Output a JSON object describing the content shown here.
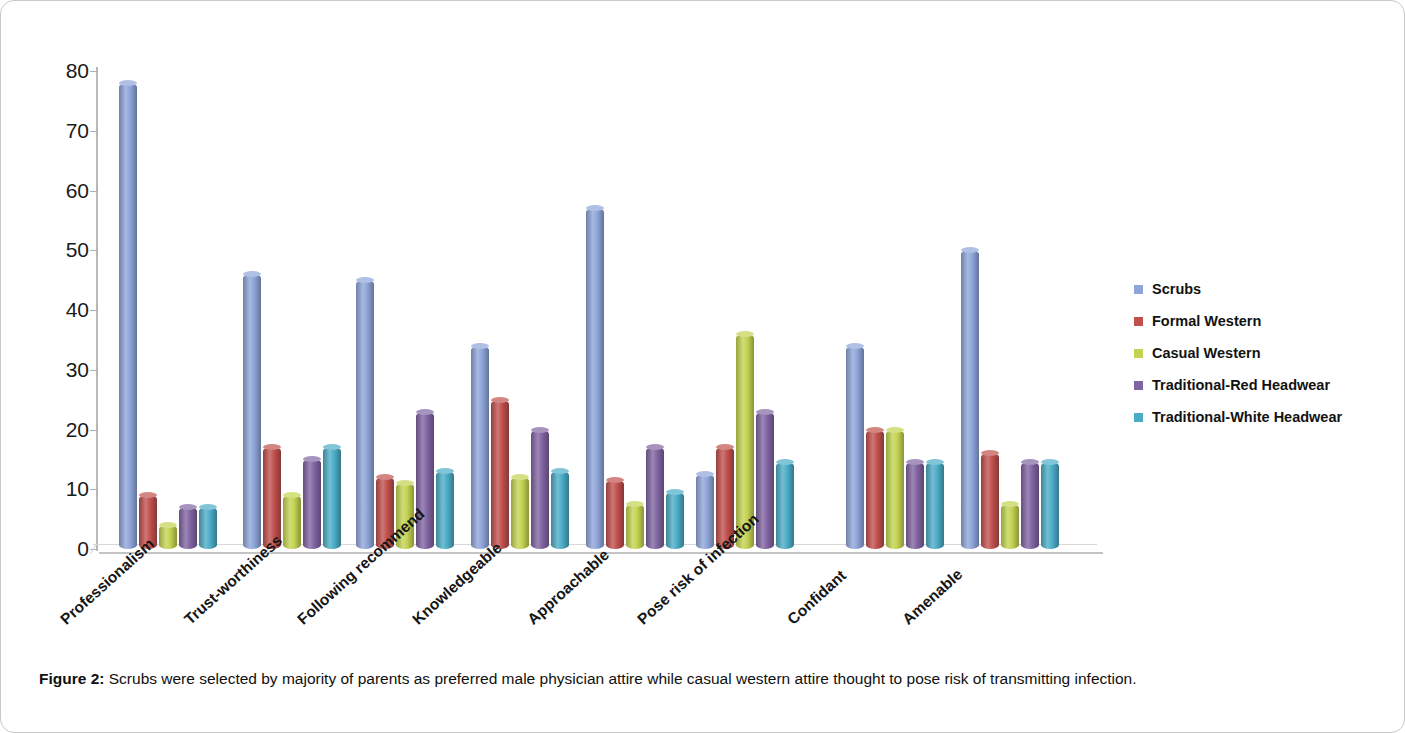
{
  "caption": {
    "label": "Figure 2:",
    "text": " Scrubs were selected by majority of parents as preferred male physician attire while casual western attire thought to pose risk of transmitting infection."
  },
  "legend": {
    "position": "right",
    "items": [
      {
        "label": "Scrubs",
        "color": "#8EA5D9"
      },
      {
        "label": "Formal Western",
        "color": "#C0504D"
      },
      {
        "label": "Casual Western",
        "color": "#C3D351"
      },
      {
        "label": "Traditional-Red Headwear",
        "color": "#8064A2"
      },
      {
        "label": "Traditional-White Headwear",
        "color": "#4BACC6"
      }
    ]
  },
  "axis": {
    "y_ticks": [
      "80",
      "70",
      "60",
      "50",
      "40",
      "30",
      "20",
      "10",
      "0"
    ]
  },
  "chart_data": {
    "type": "bar",
    "title": "",
    "subtitle": "",
    "xlabel": "",
    "ylabel": "",
    "ylim": [
      0,
      80
    ],
    "ytick_step": 10,
    "grid": false,
    "legend_position": "right",
    "categories": [
      "Professionalism",
      "Trust-worthiness",
      "Following recommend",
      "Knowledgeable",
      "Approachable",
      "Pose risk of infection",
      "Confidant",
      "Amenable"
    ],
    "series": [
      {
        "name": "Scrubs",
        "color": "#8EA5D9",
        "values": [
          78,
          46,
          45,
          34,
          57,
          12.5,
          34,
          50
        ]
      },
      {
        "name": "Formal Western",
        "color": "#C0504D",
        "values": [
          9,
          17,
          12,
          25,
          11.5,
          17,
          20,
          16
        ]
      },
      {
        "name": "Casual Western",
        "color": "#C3D351",
        "values": [
          4,
          9,
          11,
          12,
          7.5,
          36,
          20,
          7.5
        ]
      },
      {
        "name": "Traditional-Red Headwear",
        "color": "#8064A2",
        "values": [
          7,
          15,
          23,
          20,
          17,
          23,
          14.5,
          14.5
        ]
      },
      {
        "name": "Traditional-White Headwear",
        "color": "#4BACC6",
        "values": [
          7,
          17,
          13,
          13,
          9.5,
          14.5,
          14.5,
          14.5
        ]
      }
    ]
  }
}
